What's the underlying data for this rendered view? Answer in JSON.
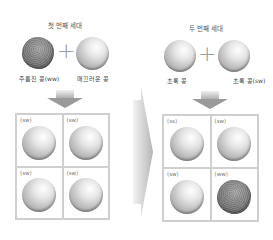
{
  "left_panel": {
    "title": "첫 번째 세대",
    "parent1": {
      "label": "주름진 콩(ww)",
      "type": "wrinkled"
    },
    "operator": "+",
    "parent2": {
      "label": "매끄러운 콩",
      "type": "smooth"
    },
    "grid": [
      {
        "label": "(sw)",
        "type": "smooth"
      },
      {
        "label": "(sw)",
        "type": "smooth"
      },
      {
        "label": "(sw)",
        "type": "smooth"
      },
      {
        "label": "(sw)",
        "type": "smooth"
      }
    ]
  },
  "right_panel": {
    "title": "두 번째 세대",
    "parent1": {
      "label": "초록 콩",
      "type": "smooth"
    },
    "operator": "+",
    "parent2": {
      "label": "초록 콩(sw)",
      "type": "smooth"
    },
    "grid": [
      {
        "label": "(ss)",
        "type": "smooth"
      },
      {
        "label": "(sw)",
        "type": "smooth"
      },
      {
        "label": "(sw)",
        "type": "smooth"
      },
      {
        "label": "(ww)",
        "type": "wrinkled"
      }
    ]
  },
  "colors": {
    "arrow": "#9a9a9a",
    "grid_border": "#cfcfcf",
    "text": "#555555"
  }
}
